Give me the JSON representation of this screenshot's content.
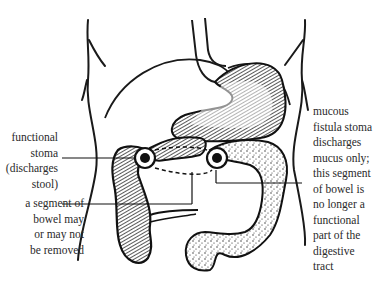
{
  "diagram": {
    "labels": {
      "functional_stoma": [
        "functional",
        "stoma",
        "(discharges",
        "stool)"
      ],
      "removed_segment": [
        "a segment of",
        "bowel may",
        "or may not",
        "be removed"
      ],
      "mucous_fistula": [
        "mucous",
        "fistula stoma",
        "discharges",
        "mucus only;",
        "this segment",
        "of bowel is",
        "no longer a",
        "functional",
        "part of the",
        "digestive",
        "tract"
      ]
    },
    "colors": {
      "ink": "#1a1a1a",
      "background": "#ffffff"
    }
  }
}
